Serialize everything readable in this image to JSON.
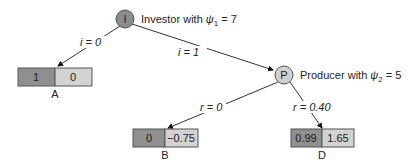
{
  "diagram": {
    "type": "game-tree",
    "nodes": {
      "investor": {
        "symbol": "I",
        "label_prefix": "Investor with ",
        "param": "ψ",
        "sub": "1",
        "value": " = 7",
        "fill": "#8c8c8c"
      },
      "producer": {
        "symbol": "P",
        "label_prefix": "Producer with ",
        "param": "ψ",
        "sub": "2",
        "value": " = 5",
        "fill": "#cfcfcf"
      }
    },
    "edges": {
      "i0": "i = 0",
      "i1": "i = 1",
      "r0": "r = 0",
      "r40": "r = 0.40"
    },
    "outcomes": {
      "A": {
        "name": "A",
        "left": "1",
        "right": "0"
      },
      "B": {
        "name": "B",
        "left": "0",
        "right": "−0.75"
      },
      "D": {
        "name": "D",
        "left": "0.99",
        "right": "1.65"
      }
    },
    "colors": {
      "dark_cell": "#8f8f8f",
      "light_cell": "#d2d2d2",
      "line": "#333333"
    }
  }
}
